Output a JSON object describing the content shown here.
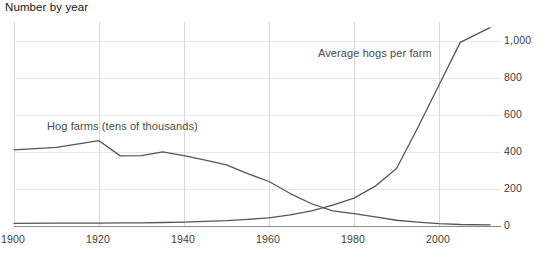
{
  "chart_data": {
    "type": "line",
    "title": "Number by year",
    "xlabel": "",
    "ylabel": "",
    "grid": true,
    "legend_position": "inline-annotations",
    "xlim": [
      1900,
      2012
    ],
    "ylim": [
      0,
      1100
    ],
    "xticks": [
      "1900",
      "1920",
      "1940",
      "1960",
      "1980",
      "2000"
    ],
    "xtick_values": [
      1900,
      1920,
      1940,
      1960,
      1980,
      2000
    ],
    "yticks": [
      "0",
      "200",
      "400",
      "600",
      "800",
      "1,000"
    ],
    "ytick_values": [
      0,
      200,
      400,
      600,
      800,
      1000
    ],
    "yaxis_side": "right",
    "series": [
      {
        "name": "Hog farms (tens of thousands)",
        "color": "#555555",
        "x": [
          1900,
          1910,
          1920,
          1925,
          1930,
          1935,
          1940,
          1945,
          1950,
          1955,
          1960,
          1965,
          1970,
          1975,
          1980,
          1985,
          1990,
          1995,
          2000,
          2005,
          2012
        ],
        "values": [
          410,
          424,
          460,
          378,
          380,
          400,
          380,
          355,
          330,
          282,
          240,
          175,
          120,
          82,
          67,
          49,
          31,
          21,
          13,
          8,
          6
        ]
      },
      {
        "name": "Average hogs per farm",
        "color": "#555555",
        "x": [
          1900,
          1910,
          1920,
          1925,
          1930,
          1935,
          1940,
          1945,
          1950,
          1955,
          1960,
          1965,
          1970,
          1975,
          1980,
          1985,
          1990,
          1995,
          2000,
          2005,
          2012
        ],
        "values": [
          14,
          16,
          15,
          17,
          17,
          19,
          21,
          25,
          29,
          36,
          44,
          60,
          82,
          113,
          150,
          215,
          310,
          530,
          760,
          990,
          1070
        ]
      }
    ],
    "annotations": [
      {
        "text": "Hog farms (tens of thousands)",
        "near_series": "Hog farms (tens of thousands)"
      },
      {
        "text": "Average hogs per farm",
        "near_series": "Average hogs per farm"
      }
    ],
    "colors": {
      "line": "#555555",
      "grid": "#e8e8e8",
      "axis": "#d8d8d8",
      "text": "#3c3c3c",
      "title": "#141414"
    }
  }
}
